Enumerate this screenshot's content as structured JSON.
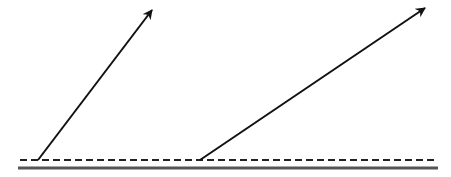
{
  "diagram": {
    "background": "#ffffff",
    "stroke_color": "#111111",
    "baseline_color": "#555555",
    "dashed_line": {
      "x1": 20,
      "y1": 160,
      "x2": 436,
      "y2": 160
    },
    "solid_line": {
      "x1": 18,
      "y1": 168,
      "x2": 438,
      "y2": 168
    },
    "arrows": [
      {
        "x1": 38,
        "y1": 160,
        "x2": 152,
        "y2": 10
      },
      {
        "x1": 200,
        "y1": 160,
        "x2": 425,
        "y2": 8
      }
    ]
  }
}
